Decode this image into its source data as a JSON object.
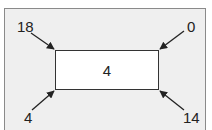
{
  "diagram": {
    "center_value": "4",
    "corners": {
      "top_left": "18",
      "top_right": "0",
      "bottom_left": "4",
      "bottom_right": "14"
    },
    "colors": {
      "frame_fill": "#efefef",
      "frame_border": "#8a8a8a",
      "box_fill": "#ffffff",
      "box_border": "#333333",
      "arrow": "#222222",
      "text": "#222222"
    }
  }
}
